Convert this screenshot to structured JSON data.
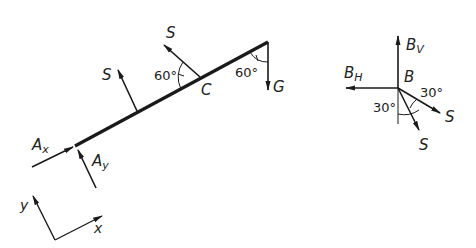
{
  "diagram": {
    "beam": {
      "labels": {
        "S_left": "S",
        "S_top": "S",
        "angle_left": "60°",
        "point_C": "C",
        "angle_right": "60°",
        "G": "G",
        "Ax": "A",
        "Ax_sub": "x",
        "Ay": "A",
        "Ay_sub": "y"
      }
    },
    "axes": {
      "x_label": "x",
      "y_label": "y"
    },
    "node_B": {
      "Bv": "B",
      "Bv_sub": "V",
      "Bh": "B",
      "Bh_sub": "H",
      "B": "B",
      "angle_right": "30°",
      "angle_left": "30°",
      "S_right": "S",
      "S_bottom": "S"
    },
    "colors": {
      "line": "#1a1a1a",
      "background": "#ffffff"
    }
  }
}
